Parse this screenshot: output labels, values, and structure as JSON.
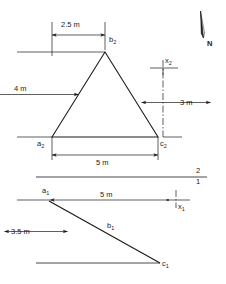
{
  "drawing": {
    "title": "two-view orthographic projection of triangle abc",
    "line_color": "#1a1a1a",
    "background": "#ffffff",
    "views": {
      "top": {
        "name": "top-view",
        "shape": "triangle",
        "vertices": [
          {
            "label": "a",
            "sub": "2"
          },
          {
            "label": "b",
            "sub": "2"
          },
          {
            "label": "c",
            "sub": "2"
          }
        ]
      },
      "front": {
        "name": "front-view",
        "shape": "line",
        "vertices": [
          {
            "label": "a",
            "sub": "1"
          },
          {
            "label": "b",
            "sub": "1"
          },
          {
            "label": "c",
            "sub": "1"
          }
        ]
      }
    },
    "dimensions": [
      {
        "id": "top-width-partial",
        "text": "2.5 m",
        "value": 2.5,
        "unit": "m",
        "orientation": "horizontal"
      },
      {
        "id": "top-height",
        "text": "4 m",
        "value": 4,
        "unit": "m",
        "orientation": "vertical"
      },
      {
        "id": "top-depth-right",
        "text": "3 m",
        "value": 3,
        "unit": "m",
        "orientation": "vertical"
      },
      {
        "id": "top-base-width",
        "text": "5 m",
        "value": 5,
        "unit": "m",
        "orientation": "horizontal"
      },
      {
        "id": "front-length",
        "text": "5 m",
        "value": 5,
        "unit": "m",
        "orientation": "horizontal"
      },
      {
        "id": "front-height",
        "text": "3.5 m",
        "value": 3.5,
        "unit": "m",
        "orientation": "vertical"
      }
    ],
    "axes": [
      {
        "id": "x2",
        "label": "x",
        "sub": "2"
      },
      {
        "id": "x1",
        "label": "x",
        "sub": "1"
      }
    ],
    "folding_line": {
      "upper_label": "2",
      "lower_label": "1"
    },
    "north_arrow": {
      "label": "N"
    }
  }
}
